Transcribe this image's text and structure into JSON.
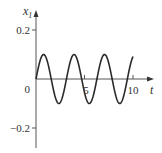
{
  "chart_data": {
    "type": "line",
    "title": "",
    "xlabel": "t",
    "ylabel": "x1",
    "ylabel_main": "x",
    "ylabel_sub": "1",
    "xlim": [
      0,
      10
    ],
    "ylim": [
      -0.28,
      0.26
    ],
    "grid": false,
    "legend": null,
    "x_ticks": [
      5,
      10
    ],
    "x_tick_labels": [
      "5",
      "10"
    ],
    "origin_label": "0",
    "y_ticks": [
      0.2,
      -0.2
    ],
    "y_tick_labels": [
      "0.2",
      "−0.2"
    ],
    "series": [
      {
        "name": "x1(t)",
        "description": "sinusoid, amplitude ~0.1, period ~3.14 (x1 = 0.1 sin 2t)",
        "amplitude": 0.1,
        "period": 3.14,
        "x": [
          0,
          0.785,
          1.571,
          2.356,
          3.142,
          3.927,
          4.712,
          5.498,
          6.283,
          7.069,
          7.854,
          8.639,
          9.425,
          10
        ],
        "values": [
          0,
          0.1,
          0,
          -0.1,
          0,
          0.1,
          0,
          -0.1,
          0,
          0.1,
          0,
          -0.1,
          0,
          0.091
        ]
      }
    ],
    "colors": {
      "axis": "#555555",
      "curve": "#2a2a2a"
    }
  }
}
